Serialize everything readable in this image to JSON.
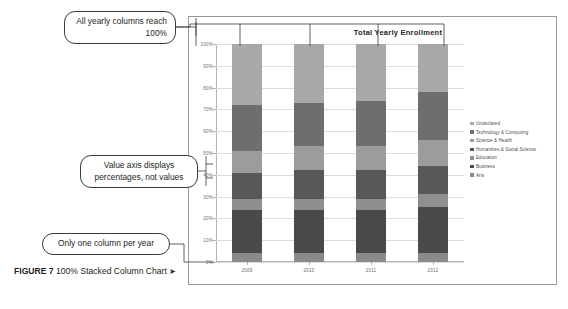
{
  "caption": {
    "label": "FIGURE 7",
    "text": " 100% Stacked Column Chart ",
    "arrow": "➤"
  },
  "callouts": [
    {
      "id": "callout-all-columns-100",
      "text": "All yearly columns reach 100%"
    },
    {
      "id": "callout-value-axis-percent",
      "text": "Value axis displays percentages, not values"
    },
    {
      "id": "callout-one-column-per-year",
      "text": "Only one column per year"
    }
  ],
  "chart_data": {
    "type": "bar",
    "stacked": "100%",
    "title": "Total Yearly Enrollment",
    "xlabel": "",
    "ylabel": "",
    "categories": [
      "2009",
      "2010",
      "2011",
      "2012"
    ],
    "ylim": [
      0,
      100
    ],
    "yticks": [
      "0%",
      "10%",
      "20%",
      "30%",
      "40%",
      "50%",
      "60%",
      "70%",
      "80%",
      "90%",
      "100%"
    ],
    "grid": true,
    "legend_position": "right",
    "series": [
      {
        "name": "Undeclared",
        "color": "#a8a8a8",
        "values": [
          28,
          27,
          26,
          22
        ]
      },
      {
        "name": "Technology & Computing",
        "color": "#6e6e6e",
        "values": [
          21,
          20,
          21,
          22
        ]
      },
      {
        "name": "Science & Health",
        "color": "#9c9c9c",
        "values": [
          10,
          11,
          11,
          12
        ]
      },
      {
        "name": "Humanities & Social Science",
        "color": "#585858",
        "values": [
          12,
          13,
          13,
          13
        ]
      },
      {
        "name": "Education",
        "color": "#8f8f8f",
        "values": [
          5,
          5,
          5,
          6
        ]
      },
      {
        "name": "Business",
        "color": "#4a4a4a",
        "values": [
          20,
          20,
          20,
          21
        ]
      },
      {
        "name": "Arts",
        "color": "#8a8a8a",
        "values": [
          4,
          4,
          4,
          4
        ]
      }
    ]
  }
}
